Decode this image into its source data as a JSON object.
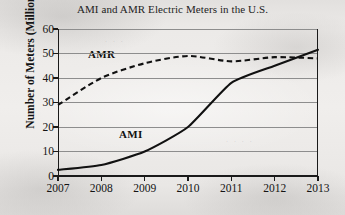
{
  "figure": {
    "background_color": "#eceae8",
    "ink_color": "#111111",
    "gridline_color": "#8d8d8d"
  },
  "chart_data": {
    "type": "line",
    "title": "AMI and AMR Electric Meters in the U.S.",
    "xlabel": "",
    "ylabel": "Number of Meters (Millions)",
    "x": [
      2007,
      2008,
      2009,
      2010,
      2011,
      2012,
      2013
    ],
    "xtick_labels": [
      "2007",
      "2008",
      "2009",
      "2010",
      "2011",
      "2012",
      "2013"
    ],
    "ytick_labels": [
      "0",
      "10",
      "20",
      "30",
      "40",
      "50",
      "60"
    ],
    "yticks": [
      0,
      10,
      20,
      30,
      40,
      50,
      60
    ],
    "xlim": [
      2007,
      2013
    ],
    "ylim": [
      0,
      60
    ],
    "grid": "horizontal",
    "legend_position": "inline-annotation",
    "series": [
      {
        "name": "AMI",
        "style": "solid",
        "color": "#111111",
        "values": [
          2.5,
          4.5,
          10.0,
          20.0,
          38.0,
          45.0,
          51.5
        ],
        "label_text": "AMI"
      },
      {
        "name": "AMR",
        "style": "dashed",
        "color": "#111111",
        "values": [
          29.0,
          40.0,
          46.0,
          49.0,
          46.8,
          48.5,
          48.0
        ],
        "label_text": "AMR"
      }
    ],
    "annotations": [
      {
        "text": "AMR",
        "x": 2008.0,
        "y": 44.0
      },
      {
        "text": "AMI",
        "x": 2009.3,
        "y": 16.5
      }
    ]
  },
  "axis": {
    "y_title": "Number of Meters (Millions)",
    "y_labels": [
      "60",
      "50",
      "40",
      "30",
      "20",
      "10",
      "0"
    ],
    "x_labels": [
      "2007",
      "2008",
      "2009",
      "2010",
      "2011",
      "2012",
      "2013"
    ]
  },
  "labels": {
    "amr": "AMR",
    "ami": "AMI"
  }
}
